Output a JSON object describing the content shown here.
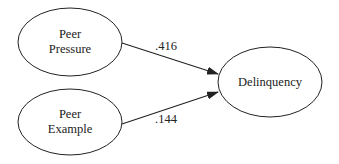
{
  "diagram": {
    "type": "path-diagram",
    "nodes": [
      {
        "id": "peer_pressure",
        "lines": [
          "Peer",
          "Pressure"
        ],
        "cx": 70,
        "cy": 42,
        "rx": 52,
        "ry": 34
      },
      {
        "id": "peer_example",
        "lines": [
          "Peer",
          "Example"
        ],
        "cx": 70,
        "cy": 122,
        "rx": 52,
        "ry": 33
      },
      {
        "id": "delinquency",
        "lines": [
          "Delinquency"
        ],
        "cx": 270,
        "cy": 82,
        "rx": 52,
        "ry": 35
      }
    ],
    "edges": [
      {
        "from": "peer_pressure",
        "to": "delinquency",
        "label": ".416"
      },
      {
        "from": "peer_example",
        "to": "delinquency",
        "label": ".144"
      }
    ],
    "colors": {
      "stroke": "#222222",
      "background": "#ffffff"
    }
  }
}
